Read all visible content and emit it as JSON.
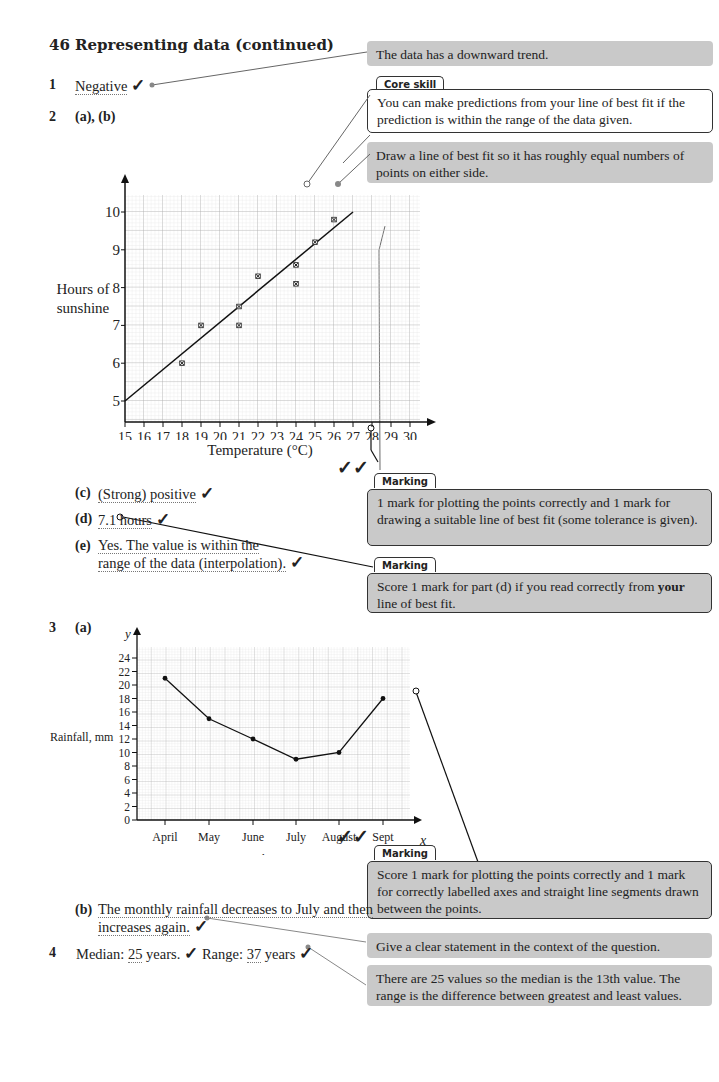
{
  "page": {
    "heading": "46 Representing data (continued)"
  },
  "q1": {
    "num": "1",
    "answer": "Negative"
  },
  "q2": {
    "num": "2",
    "parts_ab": "(a), (b)",
    "c_label": "(c)",
    "c_answer": "(Strong) positive",
    "d_label": "(d)",
    "d_answer": "7.1 hours",
    "e_label": "(e)",
    "e_line1": "Yes. The value is within the",
    "e_line2": "range of the data (interpolation)."
  },
  "q3": {
    "num": "3",
    "a_label": "(a)",
    "b_label": "(b)",
    "b_line1": "The monthly rainfall decreases to July and then",
    "b_line2": "increases again."
  },
  "q4": {
    "num": "4",
    "median_label": "Median:",
    "median_value": "25",
    "median_unit": "years.",
    "range_label": "Range:",
    "range_value": "37",
    "range_unit": "years"
  },
  "notes": {
    "trend": "The data has a downward trend.",
    "core_skill_tag": "Core skill",
    "core_skill": "You can make predictions from your line of best fit if the prediction is within the range of the data given.",
    "best_fit": "Draw a line of best fit so it has roughly equal numbers of points on either side.",
    "marking1_tag": "Marking",
    "marking1": "1 mark for plotting the points correctly and 1 mark for drawing a suitable line of best fit (some tolerance is given).",
    "marking2_tag": "Marking",
    "marking2_pre": "Score 1 mark for part (d) if you read correctly from ",
    "marking2_bold": "your",
    "marking2_post": " line of best fit.",
    "marking3_tag": "Marking",
    "marking3": "Score 1 mark for plotting the points correctly and 1 mark for correctly labelled axes and straight line segments drawn between the points.",
    "context": "Give a clear statement in the context of the question.",
    "median_note": "There are 25 values so the median is the 13th value. The range is the difference between greatest and least values."
  },
  "colors": {
    "grey_box": "#c9c9c9",
    "grid_minor": "#d8d8d8",
    "grid_major": "#a8a8a8",
    "ink": "#222222"
  },
  "chart_data": [
    {
      "type": "scatter",
      "title": "",
      "xlabel": "Temperature (°C)",
      "ylabel": "Hours of sunshine",
      "x_ticks": [
        "15",
        "16",
        "17",
        "18",
        "19",
        "20",
        "21",
        "22",
        "23",
        "24",
        "25",
        "26",
        "27",
        "28",
        "29",
        "30"
      ],
      "y_ticks": [
        "5",
        "6",
        "7",
        "8",
        "9",
        "10"
      ],
      "xlim": [
        15,
        30
      ],
      "ylim": [
        5,
        10
      ],
      "grid": true,
      "points": [
        {
          "x": 18,
          "y": 6
        },
        {
          "x": 19,
          "y": 7
        },
        {
          "x": 21,
          "y": 7.5
        },
        {
          "x": 21,
          "y": 7
        },
        {
          "x": 22,
          "y": 8.3
        },
        {
          "x": 24,
          "y": 8.6
        },
        {
          "x": 24,
          "y": 8.1
        },
        {
          "x": 25,
          "y": 9.2
        },
        {
          "x": 26,
          "y": 9.8
        }
      ],
      "line_of_best_fit": {
        "x1": 15,
        "y1": 5,
        "x2": 27,
        "y2": 10
      }
    },
    {
      "type": "line",
      "title": "",
      "xlabel": "Month",
      "ylabel": "Rainfall, mm",
      "x_axis_letter": "x",
      "y_axis_letter": "y",
      "categories": [
        "April",
        "May",
        "June",
        "July",
        "August",
        "Sept"
      ],
      "series": [
        {
          "name": "Rainfall",
          "values": [
            21,
            15,
            12,
            9,
            10,
            18
          ]
        }
      ],
      "y_ticks": [
        "0",
        "2",
        "4",
        "6",
        "8",
        "10",
        "12",
        "14",
        "16",
        "18",
        "20",
        "22",
        "24"
      ],
      "ylim": [
        0,
        24
      ],
      "grid": true
    }
  ]
}
